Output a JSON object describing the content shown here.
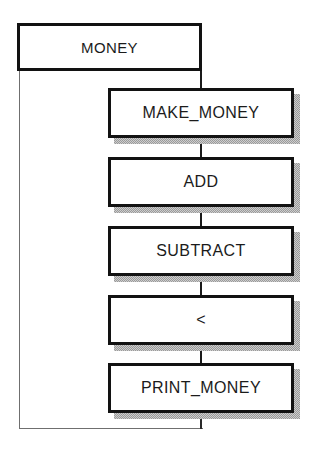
{
  "diagram": {
    "type": "flowchart",
    "background_color": "#ffffff",
    "node_border_color": "#121212",
    "node_fill_color": "#ffffff",
    "shadow_color": "#9a9a9a",
    "connector_color": "#1a1a1a",
    "loop_line_color": "#6f6f6f",
    "nodes": [
      {
        "id": "money",
        "label": "MONEY",
        "x": 17,
        "y": 23,
        "w": 185,
        "h": 48,
        "shadow": false,
        "level": "root"
      },
      {
        "id": "make_money",
        "label": "MAKE_MONEY",
        "x": 108,
        "y": 88,
        "w": 186,
        "h": 50,
        "shadow": true,
        "level": "child"
      },
      {
        "id": "add",
        "label": "ADD",
        "x": 108,
        "y": 157,
        "w": 186,
        "h": 50,
        "shadow": true,
        "level": "child"
      },
      {
        "id": "subtract",
        "label": "SUBTRACT",
        "x": 108,
        "y": 226,
        "w": 186,
        "h": 50,
        "shadow": true,
        "level": "child"
      },
      {
        "id": "less_than",
        "label": "<",
        "x": 108,
        "y": 295,
        "w": 186,
        "h": 50,
        "shadow": true,
        "level": "child"
      },
      {
        "id": "print_money",
        "label": "PRINT_MONEY",
        "x": 108,
        "y": 363,
        "w": 186,
        "h": 50,
        "shadow": true,
        "level": "child"
      }
    ],
    "connectors": [
      {
        "id": "money-to-make_money",
        "from": "money",
        "to": "make_money",
        "kind": "vertical"
      },
      {
        "id": "make_money-to-add",
        "from": "make_money",
        "to": "add",
        "kind": "vertical"
      },
      {
        "id": "add-to-subtract",
        "from": "add",
        "to": "subtract",
        "kind": "vertical"
      },
      {
        "id": "subtract-to-less_than",
        "from": "subtract",
        "to": "less_than",
        "kind": "vertical"
      },
      {
        "id": "less_than-to-print_money",
        "from": "less_than",
        "to": "print_money",
        "kind": "vertical"
      },
      {
        "id": "print_money-loop-back",
        "from": "print_money",
        "to": "money",
        "kind": "loop"
      }
    ]
  }
}
